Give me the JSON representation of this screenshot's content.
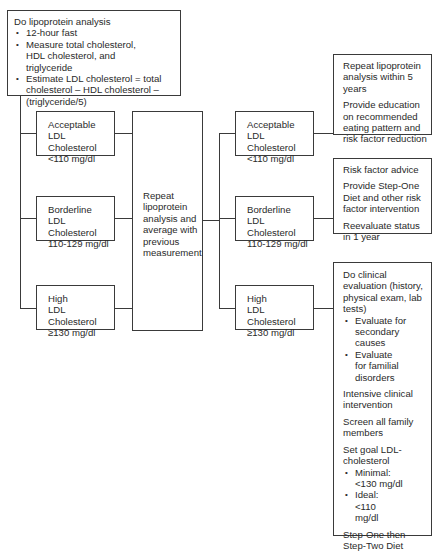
{
  "diagram": {
    "start": {
      "title": "Do lipoprotein analysis",
      "bullets": [
        "12-hour fast",
        "Measure total cholesterol, HDL cholesterol, and triglyceride",
        "Estimate LDL cholesterol = total cholesterol – HDL cholesterol – (triglyceride/5)"
      ]
    },
    "first_classification": [
      {
        "line1": "Acceptable",
        "line2": "LDL Cholesterol",
        "line3": "<110 mg/dl"
      },
      {
        "line1": "Borderline",
        "line2": "LDL Cholesterol",
        "line3": "110-129 mg/dl"
      },
      {
        "line1": "High",
        "line2": "LDL Cholesterol",
        "line3": "≥130 mg/dl"
      }
    ],
    "repeat": {
      "text": "Repeat lipoprotein analysis and average with previous measurement"
    },
    "second_classification": [
      {
        "line1": "Acceptable",
        "line2": "LDL Cholesterol",
        "line3": "<110 mg/dl"
      },
      {
        "line1": "Borderline",
        "line2": "LDL Cholesterol",
        "line3": "110-129 mg/dl"
      },
      {
        "line1": "High",
        "line2": "LDL Cholesterol",
        "line3": "≥130 mg/dl"
      }
    ],
    "actions": {
      "acceptable": [
        "Repeat lipoprotein analysis within 5 years",
        "Provide education on recommended eating pattern and risk factor reduction"
      ],
      "borderline": [
        "Risk factor advice",
        "Provide Step-One Diet and other risk factor intervention",
        "Reevaluate status in 1 year"
      ],
      "high": {
        "evaluation": "Do clinical evaluation (history, physical exam, lab tests)",
        "evaluation_bullets": [
          "Evaluate for secondary causes",
          "Evaluate for familial disorders"
        ],
        "intervention": "Intensive clinical intervention",
        "screen": "Screen all family members",
        "goal_title": "Set goal LDL-cholesterol",
        "goal_bullets": [
          "Minimal: <130 mg/dl",
          "Ideal: <110 mg/dl"
        ],
        "diet": "Step-One then Step-Two Diet"
      }
    }
  }
}
